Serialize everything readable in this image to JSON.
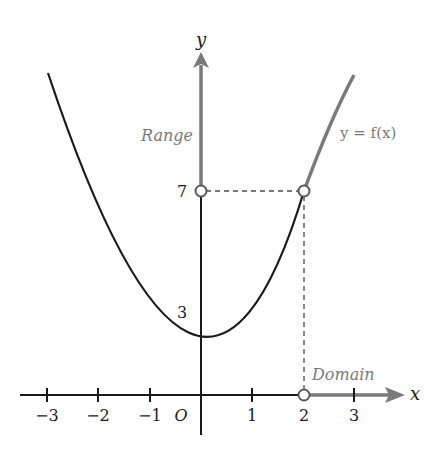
{
  "diagram": {
    "axes": {
      "x_label": "x",
      "y_label": "y",
      "origin_label": "O",
      "x_ticks": [
        "−3",
        "−2",
        "−1",
        "1",
        "2",
        "3"
      ],
      "y_ticks": [
        "7",
        "3"
      ]
    },
    "annotations": {
      "range_label": "Range",
      "domain_label": "Domain",
      "function_label": "y = f(x)"
    },
    "colors": {
      "curve": "#1a1a1a",
      "highlight": "#808080",
      "axis": "#1a1a1a"
    }
  }
}
